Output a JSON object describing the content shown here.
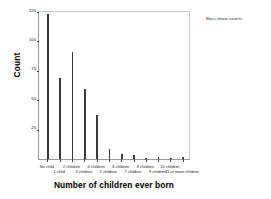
{
  "chart_data": {
    "type": "bar",
    "title": "",
    "xlabel": "Number of children ever born",
    "ylabel": "Count",
    "footnote": "Bars show counts",
    "categories": [
      "No child",
      "1 child",
      "2 children",
      "3 children",
      "4 children",
      "5 children",
      "6 children",
      "7 children",
      "8 children",
      "9 children",
      "10 children",
      "11 or more children"
    ],
    "values": [
      122,
      68,
      90,
      59,
      37,
      8,
      4,
      3,
      1,
      2,
      1,
      2
    ],
    "ylim": [
      0,
      125
    ],
    "yticks": [
      25,
      50,
      75,
      100,
      125
    ],
    "ytick_labels": [
      "25",
      "50",
      "75",
      "100",
      "125"
    ],
    "grid": false,
    "legend_position": "top-right-outside",
    "bar_color": "#3b3b3b",
    "axis_color": "#9a9a9a",
    "background_color": "#ffffff"
  }
}
